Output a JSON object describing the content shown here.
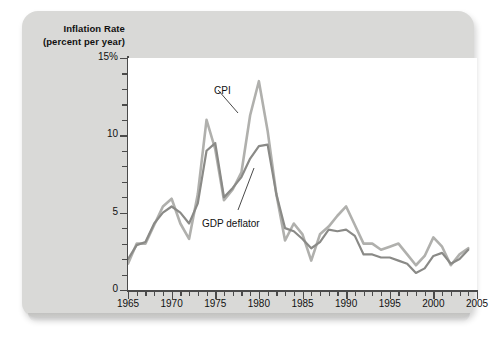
{
  "figure": {
    "y_axis_title_line1": "Inflation Rate",
    "y_axis_title_line2": "(percent per year)",
    "card_color": "#d9d9d7",
    "plot_background": "#ffffff",
    "axis_color": "#4a4a4a"
  },
  "chart_data": {
    "type": "line",
    "title": "Inflation Rate (percent per year)",
    "xlabel": "",
    "ylabel": "Inflation Rate (percent per year)",
    "xlim": [
      1965,
      2005
    ],
    "ylim": [
      0,
      15
    ],
    "grid": false,
    "legend": "annotations-on-curves",
    "y_tick_labels": [
      "0",
      "5",
      "10",
      "15%"
    ],
    "y_tick_values": [
      0,
      5,
      10,
      15
    ],
    "y_minor_step": 1,
    "x_tick_labels": [
      "1965",
      "1970",
      "1975",
      "1980",
      "1985",
      "1990",
      "1995",
      "2000",
      "2005"
    ],
    "x_tick_values": [
      1965,
      1970,
      1975,
      1980,
      1985,
      1990,
      1995,
      2000,
      2005
    ],
    "x_minor_step": 1,
    "x": [
      1965,
      1966,
      1967,
      1968,
      1969,
      1970,
      1971,
      1972,
      1973,
      1974,
      1975,
      1976,
      1977,
      1978,
      1979,
      1980,
      1981,
      1982,
      1983,
      1984,
      1985,
      1986,
      1987,
      1988,
      1989,
      1990,
      1991,
      1992,
      1993,
      1994,
      1995,
      1996,
      1997,
      1998,
      1999,
      2000,
      2001,
      2002,
      2003,
      2004
    ],
    "series": [
      {
        "name": "CPI",
        "color": "#b0b0ad",
        "width": 2.6,
        "label": "CPI",
        "values": [
          1.7,
          3.0,
          3.0,
          4.2,
          5.4,
          5.9,
          4.3,
          3.3,
          6.2,
          11.0,
          9.1,
          5.8,
          6.5,
          7.6,
          11.3,
          13.5,
          10.3,
          6.2,
          3.2,
          4.3,
          3.6,
          1.9,
          3.6,
          4.1,
          4.8,
          5.4,
          4.2,
          3.0,
          3.0,
          2.6,
          2.8,
          3.0,
          2.3,
          1.6,
          2.2,
          3.4,
          2.8,
          1.6,
          2.3,
          2.7
        ]
      },
      {
        "name": "GDP deflator",
        "color": "#8a8a87",
        "width": 2.2,
        "label": "GDP deflator",
        "values": [
          2.0,
          2.9,
          3.1,
          4.3,
          5.0,
          5.4,
          5.0,
          4.3,
          5.6,
          9.0,
          9.5,
          6.0,
          6.6,
          7.3,
          8.5,
          9.3,
          9.4,
          6.2,
          4.0,
          3.8,
          3.3,
          2.7,
          3.1,
          3.9,
          3.8,
          3.9,
          3.5,
          2.3,
          2.3,
          2.1,
          2.1,
          1.9,
          1.7,
          1.1,
          1.4,
          2.2,
          2.4,
          1.7,
          2.0,
          2.6
        ]
      }
    ],
    "annotations": [
      {
        "text": "CPI",
        "x_px": 214,
        "y_px": 85
      },
      {
        "text": "GDP deflator",
        "x_px": 202,
        "y_px": 218
      }
    ]
  }
}
